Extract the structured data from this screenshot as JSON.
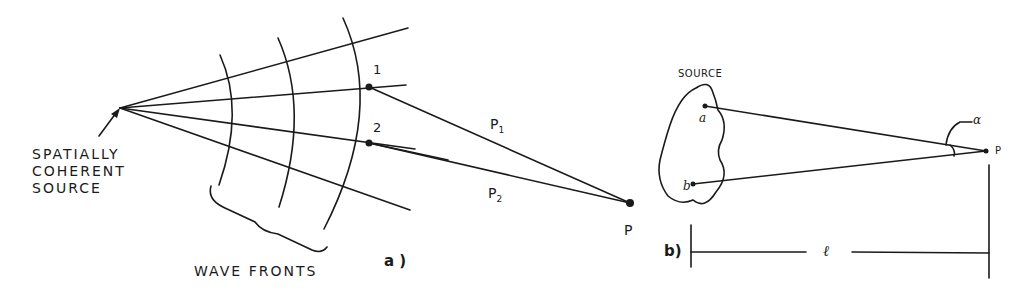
{
  "figure_a": {
    "panel_label": "a )",
    "source_label_lines": [
      "SPATIALLY",
      "COHERENT",
      "SOURCE"
    ],
    "wave_fronts_label": "WAVE FRONTS",
    "point_labels": [
      "1",
      "2"
    ],
    "path_labels": [
      {
        "main": "P",
        "sub": "1"
      },
      {
        "main": "P",
        "sub": "2"
      }
    ],
    "observation_point_label": "P"
  },
  "figure_b": {
    "panel_label": "b)",
    "source_label": "SOURCE",
    "source_points": [
      "a",
      "b"
    ],
    "angle_label": "α",
    "observation_point_label": "P",
    "distance_label": "ℓ"
  },
  "colors": {
    "ink": "#1a1a1a",
    "background": "#ffffff"
  }
}
